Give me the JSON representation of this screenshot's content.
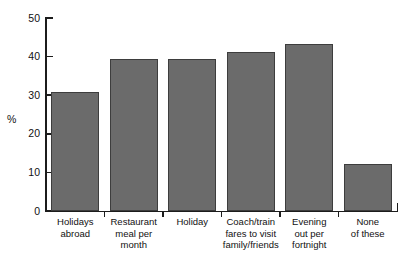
{
  "chart_data": {
    "type": "bar",
    "title": "",
    "subtitle": "",
    "xlabel": "",
    "ylabel": "%",
    "ylim": [
      0,
      50
    ],
    "yticks": [
      0,
      10,
      20,
      30,
      40,
      50
    ],
    "grid": false,
    "legend": false,
    "bar_color": "#6b6b6b",
    "bar_edge_color": "#3d3d3d",
    "axis_color": "#1c1c1c",
    "categories": [
      "Holidays\nabroad",
      "Restaurant\nmeal per\nmonth",
      "Holiday",
      "Coach/train\nfares to visit\nfamily/friends",
      "Evening\nout per\nfortnight",
      "None\nof these"
    ],
    "values": [
      30.8,
      39.3,
      39.3,
      41.2,
      43.3,
      12.1
    ]
  },
  "axis": {
    "y_title": "%",
    "tick_labels": [
      "0",
      "10",
      "20",
      "30",
      "40",
      "50"
    ]
  }
}
